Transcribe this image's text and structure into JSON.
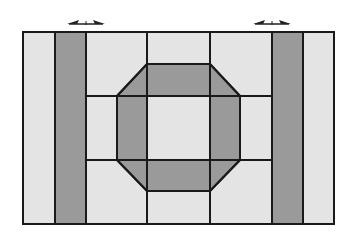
{
  "diagram": {
    "colors": {
      "background": "#ffffff",
      "light_fill": "#e4e4e4",
      "dark_fill": "#9a9a9a",
      "line": "#1a1a1a"
    },
    "frame": {
      "x": 23,
      "y": 32,
      "width": 311,
      "height": 192
    },
    "dark_strips": [
      {
        "name": "left-strip",
        "x": 55,
        "y": 32,
        "width": 31,
        "height": 192
      },
      {
        "name": "right-strip",
        "x": 272,
        "y": 32,
        "width": 31,
        "height": 192
      }
    ],
    "octagon": {
      "outer_points": "147,64 210,64 240,96 240,160 210,191 147,191 117,160 117,96",
      "inner_cell": {
        "x": 147,
        "y": 96,
        "width": 63,
        "height": 64
      }
    },
    "vertical_lines": [
      {
        "x": 55,
        "y1": 32,
        "y2": 224
      },
      {
        "x": 86,
        "y1": 32,
        "y2": 224
      },
      {
        "x": 147,
        "y1": 32,
        "y2": 224
      },
      {
        "x": 210,
        "y1": 32,
        "y2": 224
      },
      {
        "x": 272,
        "y1": 32,
        "y2": 224
      },
      {
        "x": 303,
        "y1": 32,
        "y2": 224
      }
    ],
    "horizontal_lines": [
      {
        "y": 96,
        "x1": 86,
        "x2": 272
      },
      {
        "y": 160,
        "x1": 86,
        "x2": 272
      }
    ],
    "arrows": [
      {
        "name": "left-double-arrow",
        "x1": 67,
        "x2": 105,
        "y": 24
      },
      {
        "name": "right-double-arrow",
        "x1": 253,
        "x2": 291,
        "y": 24
      }
    ]
  }
}
